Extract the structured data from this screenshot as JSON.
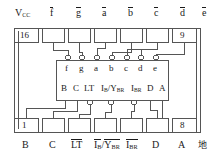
{
  "diagram": {
    "type": "ic-pinout",
    "title": "",
    "package": "16-pin DIP",
    "device_function": "BCD-to-seven-segment decoder/driver",
    "colors": {
      "line": "#555555",
      "text": "#1a1a1a",
      "background": "#ffffff"
    },
    "pin_numbers": {
      "top_left": "16",
      "top_right": "9",
      "bottom_left": "1",
      "bottom_right": "8"
    },
    "top_labels": [
      {
        "id": "vcc",
        "base": "V",
        "sub": "CC",
        "overline": false
      },
      {
        "id": "f_bar",
        "base": "f",
        "sub": "",
        "overline": true
      },
      {
        "id": "g_bar",
        "base": "g",
        "sub": "",
        "overline": true
      },
      {
        "id": "a_bar",
        "base": "a",
        "sub": "",
        "overline": true
      },
      {
        "id": "b_bar",
        "base": "b",
        "sub": "",
        "overline": true
      },
      {
        "id": "c_bar",
        "base": "c",
        "sub": "",
        "overline": true
      },
      {
        "id": "d_bar",
        "base": "d",
        "sub": "",
        "overline": true
      },
      {
        "id": "e_bar",
        "base": "e",
        "sub": "",
        "overline": true
      }
    ],
    "bottom_labels": [
      {
        "id": "B",
        "text": "B"
      },
      {
        "id": "C",
        "text": "C"
      },
      {
        "id": "LT_bar",
        "text": "LT",
        "overline": true
      },
      {
        "id": "IB_YBR",
        "text": "IB/YBR",
        "overline": true
      },
      {
        "id": "IBR_bar",
        "text": "IBR",
        "overline": true
      },
      {
        "id": "D",
        "text": "D"
      },
      {
        "id": "A",
        "text": "A"
      },
      {
        "id": "gnd",
        "text": "地"
      }
    ],
    "inner_block": {
      "outputs": [
        "f",
        "g",
        "a",
        "b",
        "c",
        "d",
        "e"
      ],
      "inputs": [
        "B",
        "C",
        "LT",
        "IB/YBR",
        "IBR",
        "D",
        "A"
      ]
    }
  }
}
